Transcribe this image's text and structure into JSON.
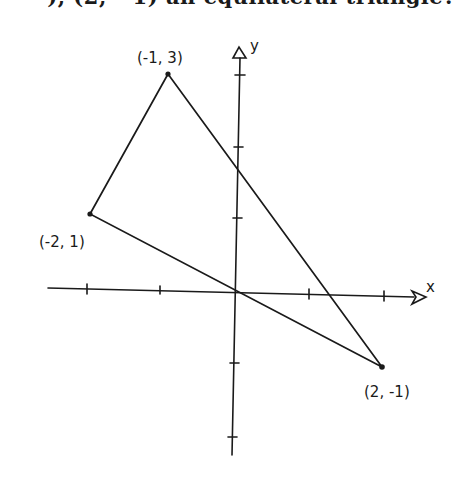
{
  "question": {
    "text": "), (2, −1) an equilateral triangle?"
  },
  "axes": {
    "x_label": "x",
    "y_label": "y"
  },
  "points": [
    {
      "label": "(-1, 3)",
      "x": -1,
      "y": 3
    },
    {
      "label": "(-2, 1)",
      "x": -2,
      "y": 1
    },
    {
      "label": "(2, -1)",
      "x": 2,
      "y": -1
    }
  ],
  "colors": {
    "ink": "#1a1a1a",
    "background": "#ffffff"
  }
}
